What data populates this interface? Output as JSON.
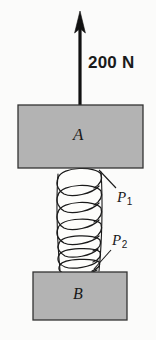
{
  "figure": {
    "background_color": "#fbfbfa",
    "width": 156,
    "height": 340
  },
  "force": {
    "label": "200 N",
    "magnitude": 200,
    "unit": "N",
    "direction": "up",
    "arrow_color": "#111111"
  },
  "blocks": [
    {
      "id": "A",
      "label": "A",
      "fill_color": "#b3b3b3",
      "stroke_color": "#333333",
      "x": 18,
      "y": 105,
      "width": 125,
      "height": 63
    },
    {
      "id": "B",
      "label": "B",
      "fill_color": "#b3b3b3",
      "stroke_color": "#333333",
      "x": 33,
      "y": 272,
      "width": 94,
      "height": 48
    }
  ],
  "spring": {
    "fill_color": "#fdfdfb",
    "stroke_color": "#1a1a1a",
    "top_y": 168,
    "bottom_y": 274,
    "left_x": 57,
    "right_x": 102,
    "segments": [
      {
        "id": "P1",
        "label": "P",
        "subscript": "1",
        "description": "upper loosely-wound coil section",
        "pitch": "wide"
      },
      {
        "id": "P2",
        "label": "P",
        "subscript": "2",
        "description": "lower tightly-wound coil section",
        "pitch": "narrow"
      }
    ]
  },
  "leaders": [
    {
      "for": "P1",
      "from_x": 116,
      "from_y": 188,
      "to_x": 99,
      "to_y": 170
    },
    {
      "for": "P2",
      "from_x": 111,
      "from_y": 250,
      "to_x": 94,
      "to_y": 269
    }
  ]
}
